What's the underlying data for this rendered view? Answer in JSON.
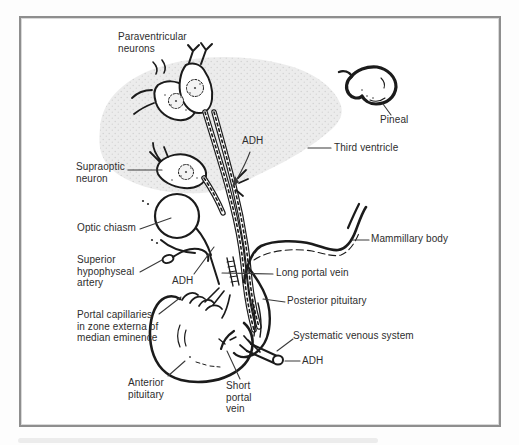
{
  "figure": {
    "kind": "anatomical-line-diagram",
    "labels": {
      "paraventricular_neurons": "Paraventricular\nneurons",
      "pineal": "Pineal",
      "third_ventricle": "Third ventricle",
      "adh_upper": "ADH",
      "supraoptic_neuron": "Supraoptic\nneuron",
      "optic_chiasm": "Optic chiasm",
      "superior_hypophyseal_artery": "Superior\nhypophyseal\nartery",
      "adh_middle": "ADH",
      "mammillary_body": "Mammillary body",
      "long_portal_vein": "Long portal vein",
      "posterior_pituitary": "Posterior pituitary",
      "portal_capillaries": "Portal capillaries\nin zone externa of\nmedian eminence",
      "systematic_venous_system": "Systematic venous system",
      "adh_lower": "ADH",
      "anterior_pituitary": "Anterior\npituitary",
      "short_portal_vein": "Short\nportal\nvein"
    },
    "colors": {
      "frame_border": "#8e8e8e",
      "line_art": "#1b1b1b",
      "label_text": "#2d2d2d",
      "third_ventricle_fill": "#ececec",
      "page_background": "#fdfdfd"
    }
  }
}
